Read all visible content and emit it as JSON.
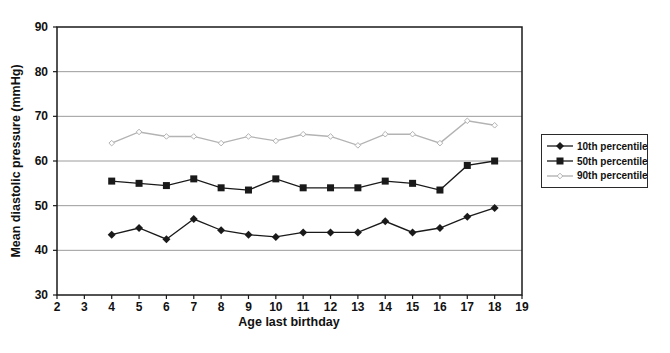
{
  "figure": {
    "background": "#ffffff"
  },
  "chart_data": {
    "type": "line",
    "title": "",
    "xlabel": "Age last birthday",
    "ylabel": "Mean diastolic pressure (mmHg)",
    "xlim": [
      2,
      19
    ],
    "ylim": [
      30,
      90
    ],
    "x_ticks": [
      2,
      3,
      4,
      5,
      6,
      7,
      8,
      9,
      10,
      11,
      12,
      13,
      14,
      15,
      16,
      17,
      18,
      19
    ],
    "y_ticks": [
      30,
      40,
      50,
      60,
      70,
      80,
      90
    ],
    "grid": "horizontal-only",
    "legend_position": "right",
    "x": [
      4,
      5,
      6,
      7,
      8,
      9,
      10,
      11,
      12,
      13,
      14,
      15,
      16,
      17,
      18
    ],
    "series": [
      {
        "name": "10th percentile",
        "marker": "filled-diamond",
        "color": "#1a1a1a",
        "values": [
          43.5,
          45,
          42.5,
          47,
          44.5,
          43.5,
          43,
          44,
          44,
          44,
          46.5,
          44,
          45,
          47.5,
          49.5
        ]
      },
      {
        "name": "50th percentile",
        "marker": "filled-square",
        "color": "#1a1a1a",
        "values": [
          55.5,
          55,
          54.5,
          56,
          54,
          53.5,
          56,
          54,
          54,
          54,
          55.5,
          55,
          53.5,
          59,
          60
        ]
      },
      {
        "name": "90th percentile",
        "marker": "open-diamond",
        "color": "#b3b3b3",
        "values": [
          64,
          66.5,
          65.5,
          65.5,
          64,
          65.5,
          64.5,
          66,
          65.5,
          63.5,
          66,
          66,
          64,
          69,
          68
        ]
      }
    ],
    "colors": {
      "grid": "#9c9c9c",
      "axis": "#1a1a1a",
      "tick_label": "#111111"
    }
  }
}
